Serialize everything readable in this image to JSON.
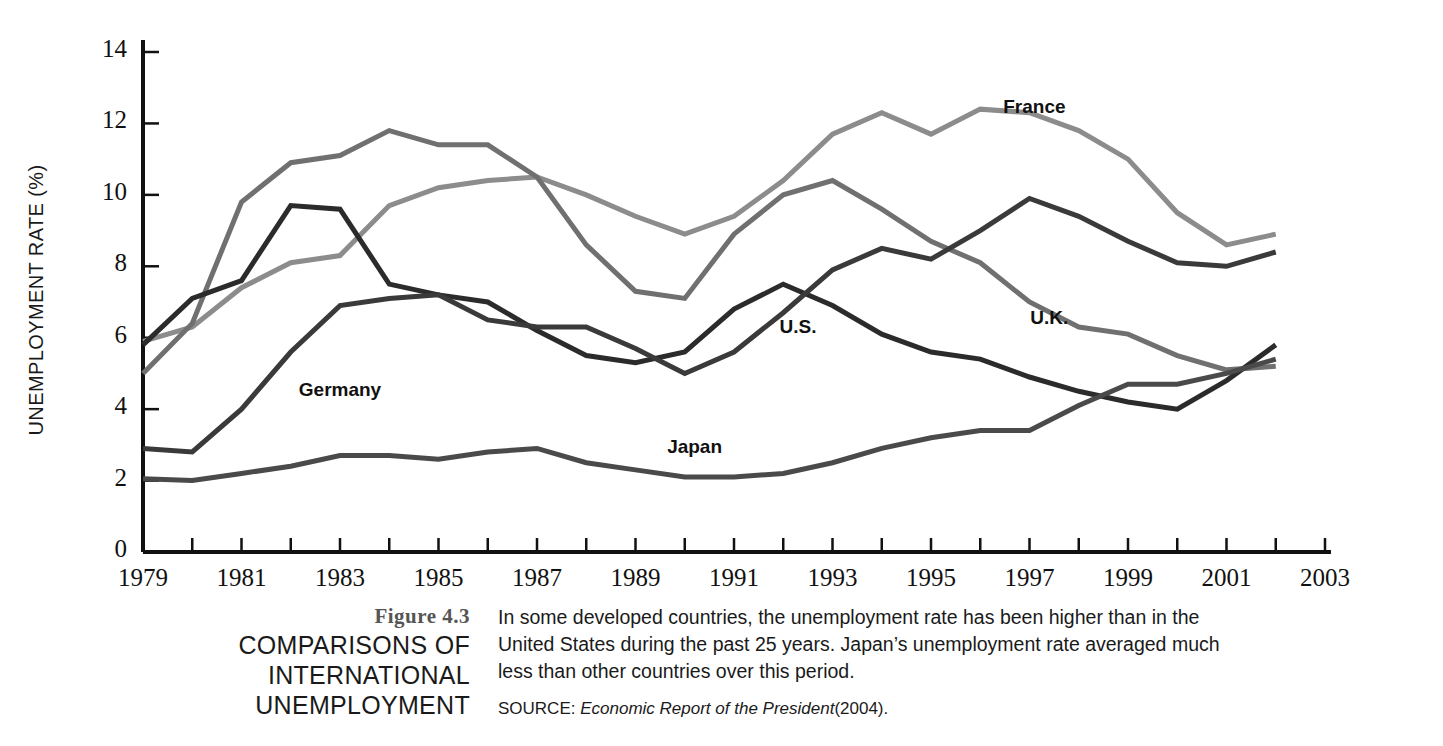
{
  "figure": {
    "number": "Figure 4.3",
    "title_lines": [
      "COMPARISONS OF",
      "INTERNATIONAL",
      "UNEMPLOYMENT"
    ],
    "caption": "In some developed countries, the unemployment rate has been higher than in the United States during the past 25 years. Japan’s unemployment rate averaged much less than other countries over this period.",
    "source_label": "SOURCE:",
    "source_title": "Economic Report of the President",
    "source_year": "(2004)."
  },
  "chart_data": {
    "type": "line",
    "title": "",
    "xlabel": "",
    "ylabel": "UNEMPLOYMENT RATE (%)",
    "xlim": [
      1979,
      2003
    ],
    "ylim": [
      0,
      14
    ],
    "yticks": [
      0,
      2,
      4,
      6,
      8,
      10,
      12,
      14
    ],
    "ytick_labels": [
      "0",
      "2",
      "4",
      "6",
      "8",
      "10",
      "12",
      "14"
    ],
    "xticks": [
      1979,
      1980,
      1981,
      1982,
      1983,
      1984,
      1985,
      1986,
      1987,
      1988,
      1989,
      1990,
      1991,
      1992,
      1993,
      1994,
      1995,
      1996,
      1997,
      1998,
      1999,
      2000,
      2001,
      2002,
      2003
    ],
    "xtick_labels_shown": [
      "1979",
      "1981",
      "1983",
      "1985",
      "1987",
      "1989",
      "1991",
      "1993",
      "1995",
      "1997",
      "1999",
      "2001",
      "2003"
    ],
    "grid": false,
    "legend": "inline-labels",
    "x": [
      1979,
      1980,
      1981,
      1982,
      1983,
      1984,
      1985,
      1986,
      1987,
      1988,
      1989,
      1990,
      1991,
      1992,
      1993,
      1994,
      1995,
      1996,
      1997,
      1998,
      1999,
      2000,
      2001,
      2002
    ],
    "series": [
      {
        "name": "France",
        "color": "#8c8c8c",
        "label_x": 1997.1,
        "label_y": 12.45,
        "values": [
          5.9,
          6.3,
          7.4,
          8.1,
          8.3,
          9.7,
          10.2,
          10.4,
          10.5,
          10.0,
          9.4,
          8.9,
          9.4,
          10.4,
          11.7,
          12.3,
          11.7,
          12.4,
          12.3,
          11.8,
          11.0,
          9.5,
          8.6,
          8.9
        ]
      },
      {
        "name": "U.K.",
        "color": "#707070",
        "label_x": 1997.4,
        "label_y": 6.55,
        "values": [
          5.0,
          6.4,
          9.8,
          10.9,
          11.1,
          11.8,
          11.4,
          11.4,
          10.5,
          8.6,
          7.3,
          7.1,
          8.9,
          10.0,
          10.4,
          9.6,
          8.7,
          8.1,
          7.0,
          6.3,
          6.1,
          5.5,
          5.1,
          5.2
        ]
      },
      {
        "name": "U.S.",
        "color": "#2b2b2b",
        "label_x": 1992.3,
        "label_y": 6.3,
        "values": [
          5.8,
          7.1,
          7.6,
          9.7,
          9.6,
          7.5,
          7.2,
          7.0,
          6.2,
          5.5,
          5.3,
          5.6,
          6.8,
          7.5,
          6.9,
          6.1,
          5.6,
          5.4,
          4.9,
          4.5,
          4.2,
          4.0,
          4.8,
          5.8
        ]
      },
      {
        "name": "Germany",
        "color": "#3a3a3a",
        "label_x": 1983.0,
        "label_y": 4.55,
        "values": [
          2.9,
          2.8,
          4.0,
          5.6,
          6.9,
          7.1,
          7.2,
          6.5,
          6.3,
          6.3,
          5.7,
          5.0,
          5.6,
          6.7,
          7.9,
          8.5,
          8.2,
          9.0,
          9.9,
          9.4,
          8.7,
          8.1,
          8.0,
          8.4
        ]
      },
      {
        "name": "Japan",
        "color": "#4a4a4a",
        "label_x": 1990.2,
        "label_y": 2.95,
        "values": [
          2.05,
          2.0,
          2.2,
          2.4,
          2.7,
          2.7,
          2.6,
          2.8,
          2.9,
          2.5,
          2.3,
          2.1,
          2.1,
          2.2,
          2.5,
          2.9,
          3.2,
          3.4,
          3.4,
          4.1,
          4.7,
          4.7,
          5.0,
          5.4
        ]
      }
    ]
  }
}
